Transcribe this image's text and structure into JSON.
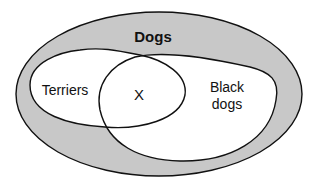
{
  "diagram": {
    "type": "venn",
    "colors": {
      "outer_fill": "#c8c8c8",
      "inner_fill": "#ffffff",
      "stroke": "#111111"
    },
    "sets": {
      "dogs": {
        "label": "Dogs"
      },
      "terriers": {
        "label": "Terriers"
      },
      "black_dogs": {
        "label_line1": "Black",
        "label_line2": "dogs"
      }
    },
    "intersection": {
      "label": "X"
    }
  }
}
